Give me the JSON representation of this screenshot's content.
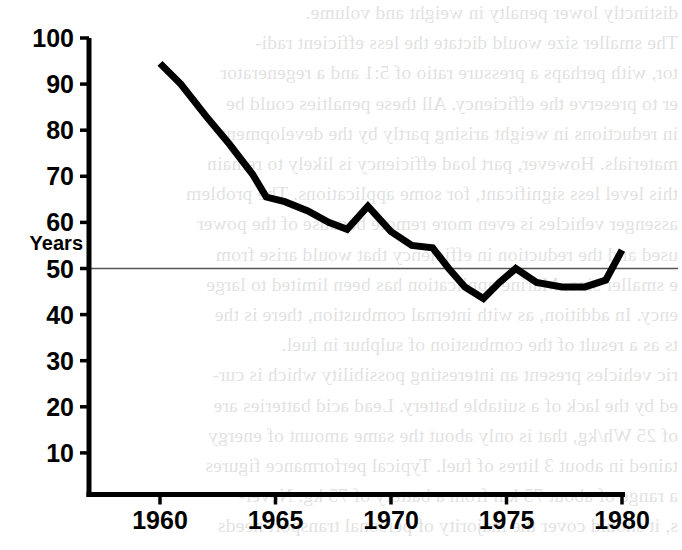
{
  "page": {
    "background_color": "#ffffff",
    "ink_color": "#000000",
    "bleed_through_text": [
      "distinctly lower penalty in weight and volume.",
      "     The smaller size would  dictate the less efficient radi-",
      "tor, with perhaps a pressure ratio of 5:1 and a regenerator",
      "er to preserve the efficiency. All these penalties could be",
      "in reductions in weight arising partly by the development",
      "materials. However, part load efficiency is likely to remain",
      "this level less significant, for some applications. The problem",
      "assenger vehicles is even more remote because of the power",
      "used and the reduction in efficiency that would arise from",
      "e smaller size. Marine application has been limited to large",
      "ency. In addition, as with internal combustion, there is the",
      "ts as a result of the combustion of sulphur in fuel.",
      "ric vehicles present an interesting possibility which is cur-",
      "ed by the lack of a suitable battery. Lead acid batteries are",
      "of 25 Wh/kg, that is only about the same amount of energy",
      "tained in about 3 litres of fuel. Typical performance figures",
      "a range of about 75 km from a battery of 75 kg. Never-",
      "s, it should cover the majority of personal transport needs"
    ]
  },
  "chart_data": {
    "type": "line",
    "title": "",
    "xlabel": "",
    "ylabel": "Years",
    "xlim": [
      1959.2,
      1980.6
    ],
    "ylim": [
      0,
      100
    ],
    "grid": false,
    "reference_lines": [
      {
        "axis": "y",
        "value": 50,
        "style": "thin-solid",
        "color": "#555555"
      }
    ],
    "y_ticks": [
      10,
      20,
      30,
      40,
      50,
      60,
      70,
      80,
      90,
      100
    ],
    "x_ticks": [
      1960,
      1965,
      1970,
      1975,
      1980
    ],
    "series": [
      {
        "name": "Years",
        "color": "#000000",
        "line_width": 7,
        "x": [
          1960.0,
          1960.9,
          1962.0,
          1963.0,
          1964.0,
          1964.6,
          1965.4,
          1966.4,
          1967.3,
          1968.1,
          1969.0,
          1970.0,
          1970.9,
          1971.8,
          1972.5,
          1973.2,
          1974.0,
          1974.7,
          1975.4,
          1976.3,
          1977.4,
          1978.4,
          1979.3,
          1980.0
        ],
        "values": [
          94.5,
          90.0,
          83.0,
          77.0,
          70.5,
          65.5,
          64.5,
          62.5,
          60.0,
          58.5,
          63.5,
          58.0,
          55.0,
          54.5,
          50.0,
          46.0,
          43.5,
          47.0,
          50.0,
          47.0,
          46.0,
          46.0,
          47.5,
          54.0
        ]
      }
    ]
  }
}
